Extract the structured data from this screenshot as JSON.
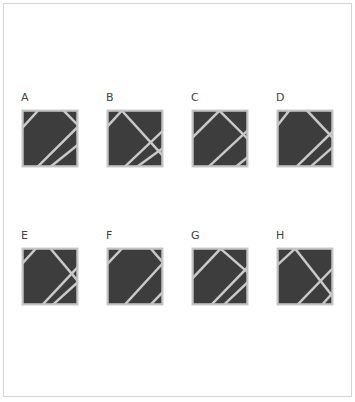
{
  "colors": {
    "fill": "#3d3d3d",
    "stroke": "#c9c9c9",
    "border": "#c4c4c4",
    "label": "#444444"
  },
  "options": [
    {
      "label": "A",
      "lines": [
        [
          [
            28,
            0
          ],
          [
            0,
            30
          ]
        ],
        [
          [
            75,
            0
          ],
          [
            100,
            25
          ]
        ],
        [
          [
            28,
            100
          ],
          [
            100,
            30
          ]
        ],
        [
          [
            52,
            100
          ],
          [
            100,
            62
          ]
        ]
      ]
    },
    {
      "label": "B",
      "lines": [
        [
          [
            26,
            0
          ],
          [
            0,
            28
          ]
        ],
        [
          [
            26,
            0
          ],
          [
            100,
            80
          ]
        ],
        [
          [
            32,
            100
          ],
          [
            100,
            37
          ]
        ],
        [
          [
            55,
            100
          ],
          [
            100,
            68
          ]
        ]
      ]
    },
    {
      "label": "C",
      "lines": [
        [
          [
            0,
            48
          ],
          [
            49,
            0
          ]
        ],
        [
          [
            49,
            0
          ],
          [
            100,
            50
          ]
        ],
        [
          [
            30,
            100
          ],
          [
            100,
            36
          ]
        ],
        [
          [
            80,
            100
          ],
          [
            100,
            84
          ]
        ]
      ]
    },
    {
      "label": "D",
      "lines": [
        [
          [
            21,
            0
          ],
          [
            0,
            26
          ]
        ],
        [
          [
            54,
            0
          ],
          [
            100,
            48
          ]
        ],
        [
          [
            35,
            100
          ],
          [
            100,
            38
          ]
        ],
        [
          [
            61,
            100
          ],
          [
            100,
            66
          ]
        ]
      ]
    },
    {
      "label": "E",
      "lines": [
        [
          [
            24,
            0
          ],
          [
            0,
            26
          ]
        ],
        [
          [
            51,
            0
          ],
          [
            100,
            57
          ]
        ],
        [
          [
            37,
            100
          ],
          [
            100,
            34
          ]
        ],
        [
          [
            56,
            100
          ],
          [
            100,
            61
          ]
        ]
      ]
    },
    {
      "label": "F",
      "lines": [
        [
          [
            26,
            0
          ],
          [
            0,
            27
          ]
        ],
        [
          [
            79,
            0
          ],
          [
            100,
            24
          ]
        ],
        [
          [
            32,
            100
          ],
          [
            100,
            27
          ]
        ],
        [
          [
            79,
            100
          ],
          [
            100,
            79
          ]
        ]
      ]
    },
    {
      "label": "G",
      "lines": [
        [
          [
            0,
            53
          ],
          [
            51,
            0
          ]
        ],
        [
          [
            51,
            0
          ],
          [
            100,
            42
          ]
        ],
        [
          [
            35,
            100
          ],
          [
            100,
            34
          ]
        ],
        [
          [
            58,
            100
          ],
          [
            100,
            61
          ]
        ]
      ]
    },
    {
      "label": "H",
      "lines": [
        [
          [
            32,
            0
          ],
          [
            0,
            29
          ]
        ],
        [
          [
            32,
            0
          ],
          [
            100,
            85
          ]
        ],
        [
          [
            37,
            100
          ],
          [
            100,
            36
          ]
        ],
        [
          [
            82,
            100
          ],
          [
            100,
            80
          ]
        ]
      ]
    }
  ]
}
